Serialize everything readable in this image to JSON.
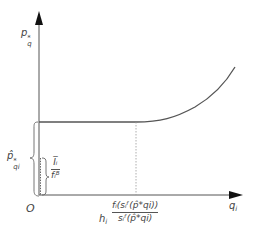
{
  "diagram": {
    "y_axis_label": {
      "base": "p",
      "sup": "*",
      "sub": "q"
    },
    "x_axis_label": {
      "base": "q",
      "sub": "i"
    },
    "origin_label": "O",
    "left_brace_label": {
      "base": "p̂",
      "sup": "*",
      "sub": "qi"
    },
    "inner_fraction": {
      "numerator": "I̅ᵢ",
      "denominator": "fᵢᴮ"
    },
    "x_marker_label": {
      "prefix": "h",
      "prefix_sub": "i",
      "numerator": "fᵢ(sᵢᶠ(p̂*qi))",
      "denominator": "sᵢᶠ(p̂*qi)"
    },
    "colors": {
      "axis": "#444444",
      "curve": "#555555",
      "dotted": "#999999"
    }
  }
}
